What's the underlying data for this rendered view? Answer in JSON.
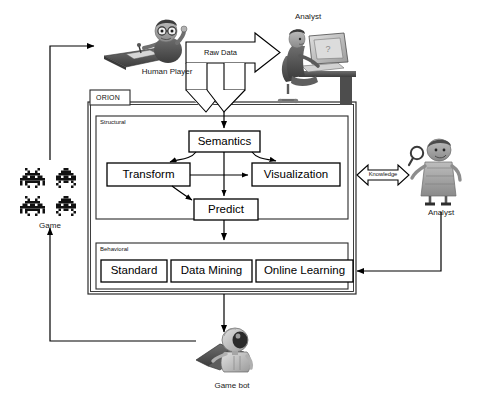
{
  "diagram": {
    "system_tab": "ORION",
    "panels": [
      {
        "id": "structural",
        "tag": "Structural"
      },
      {
        "id": "behavioral",
        "tag": "Behavioral"
      }
    ],
    "structural_nodes": [
      {
        "id": "semantics",
        "label": "Semantics"
      },
      {
        "id": "transform",
        "label": "Transform"
      },
      {
        "id": "visualization",
        "label": "Visualization"
      },
      {
        "id": "predict",
        "label": "Predict"
      }
    ],
    "behavioral_nodes": [
      {
        "id": "standard",
        "label": "Standard"
      },
      {
        "id": "data-mining",
        "label": "Data Mining"
      },
      {
        "id": "online-learning",
        "label": "Online Learning"
      }
    ],
    "flow_labels": [
      {
        "id": "raw-data",
        "label": "Raw Data"
      },
      {
        "id": "knowledge",
        "label": "Knowledge"
      }
    ],
    "actors": [
      {
        "id": "human-player",
        "label": "Human Player"
      },
      {
        "id": "analyst-top",
        "label": "Analyst"
      },
      {
        "id": "analyst-right",
        "label": "Analyst"
      },
      {
        "id": "game",
        "label": "Game"
      },
      {
        "id": "game-bot",
        "label": "Game bot"
      }
    ]
  },
  "colors": {
    "stroke": "#000000",
    "panel_border": "#2b2b2b",
    "background": "#ffffff",
    "figure_dark": "#4a4a4a",
    "figure_mid": "#8d8d8d",
    "figure_light": "#c9c9c9",
    "sprite": "#111111"
  }
}
